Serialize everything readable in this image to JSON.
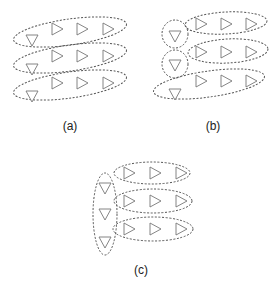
{
  "figure": {
    "panels": [
      {
        "id": "a",
        "caption": "(a)",
        "description": "Each row: one down-triangle grouped with three right-pointing triangles in one tilted ellipse"
      },
      {
        "id": "b",
        "caption": "(b)",
        "description": "Rows 1-2: down-triangle in its own circle, right triangles in a separate ellipse; row 3: all four in one ellipse"
      },
      {
        "id": "c",
        "caption": "(c)",
        "description": "All three down-triangles grouped in one vertical ellipse; each row of right triangles in its own ellipse"
      }
    ],
    "colors": {
      "stroke": "#555555",
      "triangle": "#777777",
      "background": "#ffffff"
    }
  }
}
